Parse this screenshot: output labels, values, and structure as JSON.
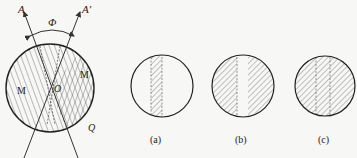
{
  "figure": {
    "main": {
      "axis_labels": {
        "A": "A",
        "A_prime": "A′",
        "angle": "Φ"
      },
      "region_labels": {
        "left": "M",
        "right": "M",
        "center": "O",
        "bottom": "Q"
      }
    },
    "panels": [
      {
        "id": "a",
        "caption": "(a)",
        "description": "single hatched vertical stripe in clear circle"
      },
      {
        "id": "b",
        "caption": "(b)",
        "description": "hatched circle with clear vertical stripe"
      },
      {
        "id": "c",
        "caption": "(c)",
        "description": "fully hatched circle with dashed stripe edges"
      }
    ],
    "colors": {
      "ink": "#333333",
      "background": "#f7f7f5"
    }
  }
}
